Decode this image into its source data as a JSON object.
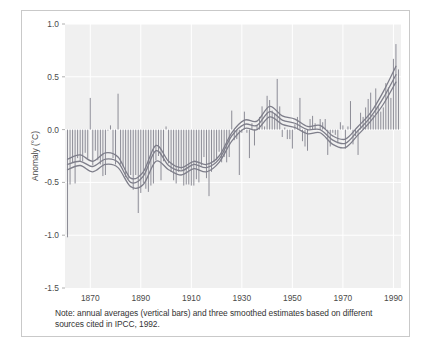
{
  "figure": {
    "caption": "Note: annual averages (vertical bars) and three smoothed estimates based on different sources cited in IPCC, 1992.",
    "border_color": "#c9c9c9",
    "background": "#ffffff"
  },
  "chart_data": {
    "type": "bar",
    "title": "",
    "subtitle": "",
    "xlabel": "",
    "ylabel": "Anomaly (°C)",
    "xlim": [
      1860,
      1993
    ],
    "ylim": [
      -1.5,
      1.0
    ],
    "yticks": [
      1.0,
      0.5,
      0.0,
      -0.5,
      -1.0,
      -1.5
    ],
    "ytick_labels": [
      "1.0",
      "0.5",
      "0.0",
      "-0.5",
      "-1.0",
      "-1.5"
    ],
    "xticks": [
      1870,
      1890,
      1910,
      1930,
      1950,
      1970,
      1990
    ],
    "xtick_labels": [
      "1870",
      "1890",
      "1910",
      "1930",
      "1950",
      "1970",
      "1990"
    ],
    "grid": true,
    "grid_color": "#ffffff",
    "plot_background": "#f0f0f0",
    "legend": "none",
    "bar_color": "#8c8c96",
    "line_color": "#7e7e8a",
    "x": [
      1861,
      1862,
      1863,
      1864,
      1865,
      1866,
      1867,
      1868,
      1869,
      1870,
      1871,
      1872,
      1873,
      1874,
      1875,
      1876,
      1877,
      1878,
      1879,
      1880,
      1881,
      1882,
      1883,
      1884,
      1885,
      1886,
      1887,
      1888,
      1889,
      1890,
      1891,
      1892,
      1893,
      1894,
      1895,
      1896,
      1897,
      1898,
      1899,
      1900,
      1901,
      1902,
      1903,
      1904,
      1905,
      1906,
      1907,
      1908,
      1909,
      1910,
      1911,
      1912,
      1913,
      1914,
      1915,
      1916,
      1917,
      1918,
      1919,
      1920,
      1921,
      1922,
      1923,
      1924,
      1925,
      1926,
      1927,
      1928,
      1929,
      1930,
      1931,
      1932,
      1933,
      1934,
      1935,
      1936,
      1937,
      1938,
      1939,
      1940,
      1941,
      1942,
      1943,
      1944,
      1945,
      1946,
      1947,
      1948,
      1949,
      1950,
      1951,
      1952,
      1953,
      1954,
      1955,
      1956,
      1957,
      1958,
      1959,
      1960,
      1961,
      1962,
      1963,
      1964,
      1965,
      1966,
      1967,
      1968,
      1969,
      1970,
      1971,
      1972,
      1973,
      1974,
      1975,
      1976,
      1977,
      1978,
      1979,
      1980,
      1981,
      1982,
      1983,
      1984,
      1985,
      1986,
      1987,
      1988,
      1989,
      1990,
      1991,
      1992
    ],
    "values": [
      -1.02,
      -0.52,
      -0.31,
      -0.51,
      -0.27,
      -0.3,
      -0.3,
      -0.22,
      -0.27,
      0.3,
      -0.34,
      -0.2,
      -0.29,
      -0.33,
      -0.44,
      -0.43,
      -0.01,
      0.04,
      -0.27,
      -0.33,
      0.34,
      -0.33,
      -0.35,
      -0.45,
      -0.47,
      -0.43,
      -0.57,
      -0.43,
      -0.79,
      -0.6,
      -0.51,
      -0.56,
      -0.59,
      -0.53,
      -0.51,
      -0.29,
      -0.25,
      -0.48,
      -0.3,
      0.03,
      -0.32,
      -0.4,
      -0.48,
      -0.51,
      -0.4,
      -0.38,
      -0.53,
      -0.52,
      -0.52,
      -0.53,
      -0.53,
      -0.47,
      -0.5,
      -0.34,
      -0.26,
      -0.46,
      -0.63,
      -0.4,
      -0.31,
      -0.29,
      -0.21,
      -0.31,
      -0.26,
      -0.31,
      -0.26,
      0.18,
      -0.1,
      -0.09,
      -0.43,
      -0.03,
      0.17,
      -0.03,
      -0.27,
      0.06,
      -0.15,
      0.04,
      0.12,
      0.22,
      0.03,
      0.32,
      0.28,
      0.18,
      0.15,
      0.48,
      0.22,
      -0.07,
      0.02,
      -0.09,
      -0.09,
      -0.18,
      0.05,
      0.12,
      0.3,
      -0.11,
      -0.16,
      -0.2,
      0.1,
      0.13,
      0.06,
      0.0,
      0.1,
      0.07,
      0.1,
      -0.24,
      -0.16,
      -0.03,
      -0.05,
      -0.13,
      0.07,
      0.04,
      -0.18,
      0.03,
      0.27,
      -0.14,
      -0.06,
      -0.24,
      0.16,
      0.12,
      0.21,
      0.29,
      0.35,
      0.14,
      0.39,
      0.22,
      0.17,
      0.21,
      0.44,
      0.4,
      0.3,
      0.67,
      0.81,
      0.57
    ],
    "series": [
      {
        "name": "smoothed estimate 1",
        "smooth": true,
        "x": [
          1861,
          1866,
          1871,
          1876,
          1881,
          1886,
          1891,
          1896,
          1901,
          1906,
          1911,
          1916,
          1921,
          1926,
          1931,
          1936,
          1941,
          1946,
          1951,
          1956,
          1961,
          1966,
          1971,
          1976,
          1981,
          1986,
          1991
        ],
        "values": [
          -0.28,
          -0.24,
          -0.3,
          -0.22,
          -0.26,
          -0.46,
          -0.4,
          -0.15,
          -0.3,
          -0.36,
          -0.3,
          -0.33,
          -0.25,
          -0.03,
          0.09,
          0.08,
          0.22,
          0.13,
          0.1,
          0.03,
          0.04,
          -0.06,
          -0.09,
          0.03,
          0.16,
          0.36,
          0.6
        ]
      },
      {
        "name": "smoothed estimate 2",
        "smooth": true,
        "x": [
          1861,
          1866,
          1871,
          1876,
          1881,
          1886,
          1891,
          1896,
          1901,
          1906,
          1911,
          1916,
          1921,
          1926,
          1931,
          1936,
          1941,
          1946,
          1951,
          1956,
          1961,
          1966,
          1971,
          1976,
          1981,
          1986,
          1991
        ],
        "values": [
          -0.33,
          -0.3,
          -0.35,
          -0.28,
          -0.31,
          -0.5,
          -0.44,
          -0.2,
          -0.34,
          -0.39,
          -0.33,
          -0.36,
          -0.28,
          -0.06,
          0.05,
          0.04,
          0.17,
          0.09,
          0.06,
          0.0,
          0.0,
          -0.1,
          -0.13,
          -0.01,
          0.12,
          0.3,
          0.52
        ]
      },
      {
        "name": "smoothed estimate 3",
        "smooth": true,
        "x": [
          1861,
          1866,
          1871,
          1876,
          1881,
          1886,
          1891,
          1896,
          1901,
          1906,
          1911,
          1916,
          1921,
          1926,
          1931,
          1936,
          1941,
          1946,
          1951,
          1956,
          1961,
          1966,
          1971,
          1976,
          1981,
          1986,
          1991
        ],
        "values": [
          -0.38,
          -0.34,
          -0.4,
          -0.33,
          -0.36,
          -0.54,
          -0.52,
          -0.3,
          -0.38,
          -0.43,
          -0.37,
          -0.4,
          -0.31,
          -0.11,
          0.01,
          0.0,
          0.12,
          0.05,
          0.02,
          -0.04,
          -0.03,
          -0.14,
          -0.17,
          -0.05,
          0.08,
          0.24,
          0.45
        ]
      }
    ]
  }
}
